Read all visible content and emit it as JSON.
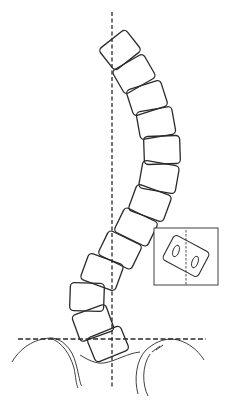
{
  "figure": {
    "width": 227,
    "height": 405,
    "stroke_color": "#2a2a2a",
    "background": "#ffffff",
    "plumb_line": {
      "x": 112,
      "y1": 12,
      "y2": 388
    },
    "pelvic_line": {
      "y": 339,
      "x1": 18,
      "x2": 206
    },
    "vertebrae": [
      {
        "cx": 120,
        "cy": 50,
        "w": 34,
        "h": 27,
        "rot": -38
      },
      {
        "cx": 134,
        "cy": 74,
        "w": 36,
        "h": 27,
        "rot": -30
      },
      {
        "cx": 147,
        "cy": 98,
        "w": 36,
        "h": 27,
        "rot": -18
      },
      {
        "cx": 156,
        "cy": 123,
        "w": 36,
        "h": 28,
        "rot": -10
      },
      {
        "cx": 162,
        "cy": 150,
        "w": 36,
        "h": 28,
        "rot": -2
      },
      {
        "cx": 159,
        "cy": 177,
        "w": 37,
        "h": 28,
        "rot": 10
      },
      {
        "cx": 150,
        "cy": 203,
        "w": 37,
        "h": 28,
        "rot": 20
      },
      {
        "cx": 136,
        "cy": 227,
        "w": 37,
        "h": 27,
        "rot": 26
      },
      {
        "cx": 120,
        "cy": 250,
        "w": 37,
        "h": 27,
        "rot": 26
      },
      {
        "cx": 102,
        "cy": 272,
        "w": 37,
        "h": 28,
        "rot": 20
      },
      {
        "cx": 87,
        "cy": 297,
        "w": 34,
        "h": 28,
        "rot": 2
      },
      {
        "cx": 93,
        "cy": 323,
        "w": 36,
        "h": 28,
        "rot": -20
      },
      {
        "cx": 108,
        "cy": 344,
        "w": 36,
        "h": 26,
        "rot": -22
      }
    ],
    "inset": {
      "x": 154,
      "y": 228,
      "w": 64,
      "h": 57,
      "center_line_x": 186,
      "vertebra": {
        "cx": 186,
        "cy": 256,
        "w": 40,
        "h": 28,
        "rot": 28
      },
      "pedicles": [
        {
          "cx": 176,
          "cy": 251,
          "rx": 3,
          "ry": 6,
          "rot": 20
        },
        {
          "cx": 195,
          "cy": 262,
          "rx": 3,
          "ry": 6,
          "rot": 20
        }
      ]
    }
  }
}
